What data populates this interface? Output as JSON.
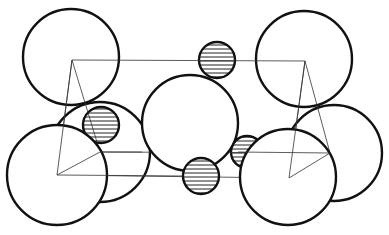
{
  "diagram": {
    "kind": "crystal unit cell (ionic packing)",
    "legend": {
      "large_atom": "open circle",
      "small_atom": "horizontally hatched circle"
    },
    "atoms_large_count": 7,
    "atoms_small_count": 4,
    "colors": {
      "stroke": "#111111",
      "background": "#ffffff",
      "hatch": "#222222"
    }
  }
}
